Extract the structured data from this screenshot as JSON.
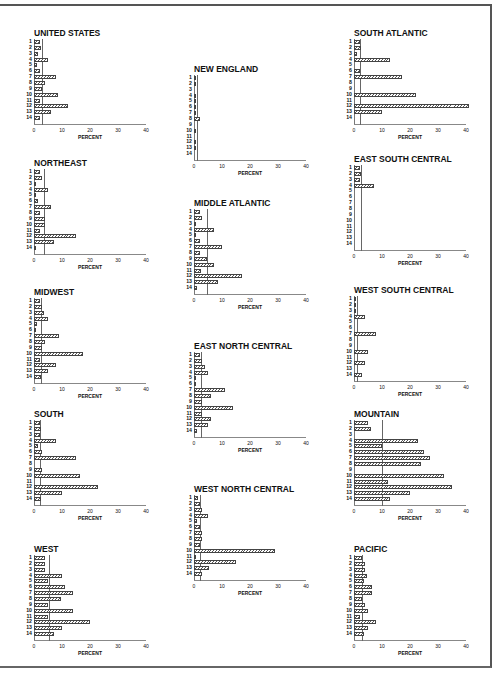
{
  "page": {
    "frame": true
  },
  "chart_data": [
    {
      "type": "bar",
      "orientation": "horizontal",
      "title": "UNITED STATES",
      "categories": [
        "1",
        "2",
        "3",
        "4",
        "5",
        "6",
        "7",
        "8",
        "9",
        "10",
        "11",
        "12",
        "13",
        "14"
      ],
      "values": [
        2,
        2.5,
        1.5,
        5,
        1,
        2,
        8,
        4,
        3,
        8.5,
        2,
        12,
        6,
        2
      ],
      "reference_line": 3,
      "xlabel": "PERCENT",
      "xticks": [
        0,
        10,
        20,
        30,
        40
      ],
      "xlim": [
        0,
        40
      ]
    },
    {
      "type": "bar",
      "orientation": "horizontal",
      "title": "NEW ENGLAND",
      "categories": [
        "1",
        "2",
        "3",
        "4",
        "5",
        "6",
        "7",
        "8",
        "9",
        "10",
        "11",
        "12",
        "13",
        "14"
      ],
      "values": [
        0.5,
        0.5,
        0,
        0.8,
        0.8,
        0.8,
        0.8,
        2,
        0,
        0.8,
        0,
        0.8,
        0.8,
        0
      ],
      "reference_line": 1,
      "xlabel": "PERCENT",
      "xticks": [
        0,
        10,
        20,
        30,
        40
      ],
      "xlim": [
        0,
        40
      ]
    },
    {
      "type": "bar",
      "orientation": "horizontal",
      "title": "SOUTH ATLANTIC",
      "categories": [
        "1",
        "2",
        "3",
        "4",
        "5",
        "6",
        "7",
        "8",
        "9",
        "10",
        "11",
        "12",
        "13",
        "14"
      ],
      "values": [
        2,
        2.5,
        1,
        13,
        0,
        2,
        17,
        0,
        0,
        22,
        0,
        41,
        10,
        0
      ],
      "reference_line": 2,
      "xlabel": "PERCENT",
      "xticks": [
        0,
        10,
        20,
        30,
        40
      ],
      "xlim": [
        0,
        40
      ]
    },
    {
      "type": "bar",
      "orientation": "horizontal",
      "title": "NORTHEAST",
      "categories": [
        "1",
        "2",
        "3",
        "4",
        "5",
        "6",
        "7",
        "8",
        "9",
        "10",
        "11",
        "12",
        "13",
        "14"
      ],
      "values": [
        2,
        3,
        0.5,
        5,
        0.5,
        1.5,
        6,
        2,
        4,
        4,
        2,
        15,
        7,
        0.3
      ],
      "reference_line": 3.5,
      "xlabel": "PERCENT",
      "xticks": [
        0,
        10,
        20,
        30,
        40
      ],
      "xlim": [
        0,
        40
      ]
    },
    {
      "type": "bar",
      "orientation": "horizontal",
      "title": "MIDDLE ATLANTIC",
      "categories": [
        "1",
        "2",
        "3",
        "4",
        "5",
        "6",
        "7",
        "8",
        "9",
        "10",
        "11",
        "12",
        "13",
        "14"
      ],
      "values": [
        2,
        3,
        0.5,
        7,
        0.5,
        2,
        10,
        2,
        4.5,
        7,
        2.5,
        17,
        8.5,
        1
      ],
      "reference_line": 4.5,
      "xlabel": "PERCENT",
      "xticks": [
        0,
        10,
        20,
        30,
        40
      ],
      "xlim": [
        0,
        40
      ]
    },
    {
      "type": "bar",
      "orientation": "horizontal",
      "title": "EAST SOUTH CENTRAL",
      "categories": [
        "1",
        "2",
        "3",
        "4",
        "5",
        "6",
        "7",
        "8",
        "9",
        "10",
        "11",
        "12",
        "13",
        "14"
      ],
      "values": [
        2,
        2.5,
        2,
        7,
        0,
        0,
        0,
        0,
        0,
        0,
        0,
        0,
        0,
        0
      ],
      "reference_line": 2.5,
      "xlabel": "PERCENT",
      "xticks": [
        0,
        10,
        20,
        30,
        40
      ],
      "xlim": [
        0,
        40
      ]
    },
    {
      "type": "bar",
      "orientation": "horizontal",
      "title": "MIDWEST",
      "categories": [
        "1",
        "2",
        "3",
        "4",
        "5",
        "6",
        "7",
        "8",
        "9",
        "10",
        "11",
        "12",
        "13",
        "14"
      ],
      "values": [
        2,
        3,
        3.5,
        5,
        1,
        0.8,
        9,
        4,
        3,
        17.5,
        2,
        8,
        5,
        2.5
      ],
      "reference_line": 2.5,
      "xlabel": "PERCENT",
      "xticks": [
        0,
        10,
        20,
        30,
        40
      ],
      "xlim": [
        0,
        40
      ]
    },
    {
      "type": "bar",
      "orientation": "horizontal",
      "title": "EAST NORTH CENTRAL",
      "categories": [
        "1",
        "2",
        "3",
        "4",
        "5",
        "6",
        "7",
        "8",
        "9",
        "10",
        "11",
        "12",
        "13",
        "14"
      ],
      "values": [
        2,
        3,
        4,
        5,
        0.5,
        0.5,
        11,
        6,
        3,
        14,
        3,
        6,
        5,
        1
      ],
      "reference_line": 2.5,
      "xlabel": "PERCENT",
      "xticks": [
        0,
        10,
        20,
        30,
        40
      ],
      "xlim": [
        0,
        40
      ]
    },
    {
      "type": "bar",
      "orientation": "horizontal",
      "title": "WEST SOUTH CENTRAL",
      "categories": [
        "1",
        "2",
        "3",
        "4",
        "5",
        "6",
        "7",
        "8",
        "9",
        "10",
        "11",
        "12",
        "13",
        "14"
      ],
      "values": [
        0.5,
        0.5,
        0.3,
        4,
        0,
        0,
        8,
        0,
        0,
        5,
        0,
        4,
        0,
        3
      ],
      "reference_line": 1,
      "xlabel": "PERCENT",
      "xticks": [
        0,
        10,
        20,
        30,
        40
      ],
      "xlim": [
        0,
        40
      ]
    },
    {
      "type": "bar",
      "orientation": "horizontal",
      "title": "SOUTH",
      "categories": [
        "1",
        "2",
        "3",
        "4",
        "5",
        "6",
        "7",
        "8",
        "9",
        "10",
        "11",
        "12",
        "13",
        "14"
      ],
      "values": [
        2,
        2.5,
        2,
        8,
        1.5,
        3,
        15,
        0,
        3,
        16.5,
        0,
        23,
        10,
        2.5
      ],
      "reference_line": 2,
      "xlabel": "PERCENT",
      "xticks": [
        0,
        10,
        20,
        30,
        40
      ],
      "xlim": [
        0,
        40
      ]
    },
    {
      "type": "bar",
      "orientation": "horizontal",
      "title": "MOUNTAIN",
      "categories": [
        "1",
        "2",
        "3",
        "4",
        "5",
        "6",
        "7",
        "8",
        "9",
        "10",
        "11",
        "12",
        "13",
        "14"
      ],
      "values": [
        5,
        6,
        0,
        23,
        10,
        25,
        27,
        24,
        0,
        32,
        12,
        35,
        20,
        13
      ],
      "reference_line": 10,
      "xlabel": "PERCENT",
      "xticks": [
        0,
        10,
        20,
        30,
        40
      ],
      "xlim": [
        0,
        40
      ]
    },
    {
      "type": "bar",
      "orientation": "horizontal",
      "title": "WEST NORTH CENTRAL",
      "categories": [
        "1",
        "2",
        "3",
        "4",
        "5",
        "6",
        "7",
        "8",
        "9",
        "10",
        "11",
        "12",
        "13",
        "14"
      ],
      "values": [
        1.5,
        2,
        3,
        5,
        1,
        2,
        3,
        3,
        2,
        29,
        0.5,
        15,
        5.5,
        3
      ],
      "reference_line": 2,
      "xlabel": "PERCENT",
      "xticks": [
        0,
        10,
        20,
        30,
        40
      ],
      "xlim": [
        0,
        40
      ]
    },
    {
      "type": "bar",
      "orientation": "horizontal",
      "title": "WEST",
      "categories": [
        "1",
        "2",
        "3",
        "4",
        "5",
        "6",
        "7",
        "8",
        "9",
        "10",
        "11",
        "12",
        "13",
        "14"
      ],
      "values": [
        4,
        4,
        4,
        10,
        5,
        11,
        14,
        9.5,
        5,
        14,
        5,
        20,
        10,
        7
      ],
      "reference_line": 5.5,
      "xlabel": "PERCENT",
      "xticks": [
        0,
        10,
        20,
        30,
        40
      ],
      "xlim": [
        0,
        40
      ]
    },
    {
      "type": "bar",
      "orientation": "horizontal",
      "title": "PACIFIC",
      "categories": [
        "1",
        "2",
        "3",
        "4",
        "5",
        "6",
        "7",
        "8",
        "9",
        "10",
        "11",
        "12",
        "13",
        "14"
      ],
      "values": [
        3,
        4,
        4,
        4.5,
        3.5,
        6.5,
        6.5,
        3,
        4,
        5,
        2,
        8,
        5,
        3.5
      ],
      "reference_line": 3,
      "xlabel": "PERCENT",
      "xticks": [
        0,
        10,
        20,
        30,
        40
      ],
      "xlim": [
        0,
        40
      ]
    }
  ],
  "layout": [
    {
      "left": 20,
      "top": 28
    },
    {
      "left": 180,
      "top": 64
    },
    {
      "left": 340,
      "top": 28
    },
    {
      "left": 20,
      "top": 158
    },
    {
      "left": 180,
      "top": 198
    },
    {
      "left": 340,
      "top": 154
    },
    {
      "left": 20,
      "top": 287
    },
    {
      "left": 180,
      "top": 341
    },
    {
      "left": 340,
      "top": 285
    },
    {
      "left": 20,
      "top": 409
    },
    {
      "left": 340,
      "top": 409
    },
    {
      "left": 180,
      "top": 484
    },
    {
      "left": 20,
      "top": 544
    },
    {
      "left": 340,
      "top": 544
    }
  ]
}
